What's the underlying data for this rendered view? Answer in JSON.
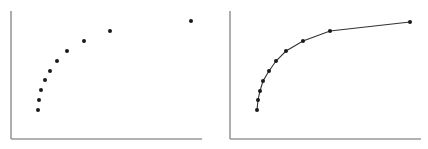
{
  "chart_data": [
    {
      "type": "scatter",
      "title": "",
      "xlabel": "",
      "ylabel": "",
      "grid": false,
      "legend": null,
      "series": [
        {
          "name": "points",
          "x": [
            1,
            2,
            4,
            8,
            13,
            20,
            30,
            47,
            73,
            154
          ],
          "y": [
            1,
            2,
            3,
            4,
            5,
            6,
            7,
            8,
            9,
            10
          ]
        }
      ],
      "xlim": [
        -25,
        165
      ],
      "ylim": [
        -2,
        11
      ]
    },
    {
      "type": "line",
      "title": "",
      "xlabel": "",
      "ylabel": "",
      "grid": false,
      "legend": null,
      "markers": true,
      "series": [
        {
          "name": "curve",
          "x": [
            1,
            2,
            4,
            8,
            13,
            20,
            30,
            47,
            73,
            154
          ],
          "y": [
            1,
            2,
            3,
            4,
            5,
            6,
            7,
            8,
            9,
            10
          ]
        }
      ],
      "xlim": [
        -25,
        165
      ],
      "ylim": [
        -2,
        11
      ]
    }
  ],
  "colors": {
    "axis": "#999999",
    "point": "#1a1a1a",
    "line": "#333333"
  },
  "panels": [
    {
      "name": "left-scatter",
      "axis_x": 11,
      "axis_bottom": 139,
      "axis_top": 11,
      "axis_right": 202,
      "points_px": [
        [
          38,
          110
        ],
        [
          39,
          100
        ],
        [
          41,
          90
        ],
        [
          45,
          80
        ],
        [
          50,
          71
        ],
        [
          57,
          61
        ],
        [
          67,
          51
        ],
        [
          84,
          41
        ],
        [
          110,
          31
        ],
        [
          191,
          21
        ]
      ],
      "connect": false
    },
    {
      "name": "right-line",
      "axis_x": 230,
      "axis_bottom": 139,
      "axis_top": 11,
      "axis_right": 421,
      "points_px": [
        [
          257,
          110
        ],
        [
          258,
          100
        ],
        [
          260,
          91
        ],
        [
          263,
          81
        ],
        [
          269,
          71
        ],
        [
          276,
          61
        ],
        [
          286,
          51
        ],
        [
          303,
          41
        ],
        [
          330,
          31
        ],
        [
          410,
          22
        ]
      ],
      "connect": true
    }
  ]
}
